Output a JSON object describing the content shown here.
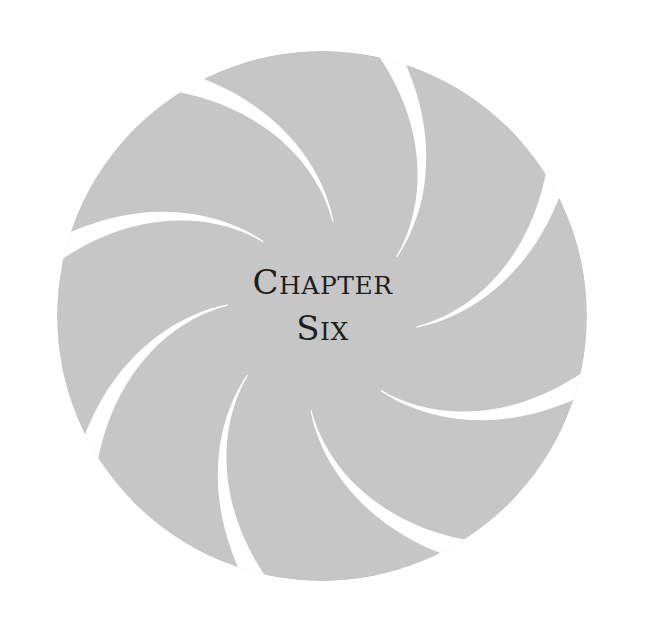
{
  "page": {
    "background": "#ffffff",
    "emblem": {
      "shape": "swirl-circle",
      "fill": "#c6c6c6",
      "slit_color": "#ffffff",
      "slit_count": 8
    },
    "title": {
      "line1": {
        "initial": "C",
        "rest": "HAPTER"
      },
      "line2": {
        "initial": "S",
        "rest": "IX"
      },
      "full": "Chapter Six"
    }
  }
}
